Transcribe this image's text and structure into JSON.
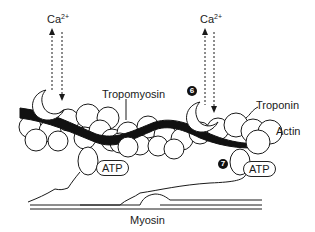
{
  "diagram": {
    "type": "muscle-contraction-sliding-filament",
    "labels": {
      "calcium_left": {
        "base": "Ca",
        "sup": "2+"
      },
      "calcium_right": {
        "base": "Ca",
        "sup": "2+"
      },
      "tropomyosin": "Tropomyosin",
      "troponin": "Troponin",
      "actin": "Actin",
      "myosin": "Myosin",
      "atp_left": "ATP",
      "atp_right": "ATP"
    },
    "step_badges": {
      "step6": "6",
      "step7": "7"
    },
    "colors": {
      "line": "#1a1a1a",
      "fill": "#ffffff",
      "tropomyosin_strand": "#111111"
    }
  }
}
